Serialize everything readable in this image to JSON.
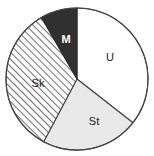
{
  "chart_data": {
    "type": "pie",
    "title": "",
    "subtitle": "",
    "xlabel": "",
    "ylabel": "",
    "legend_position": "none",
    "grid": false,
    "labels_inside": true,
    "start_angle_deg": 0,
    "direction": "clockwise",
    "categories": [
      "U",
      "St",
      "Sk",
      "M"
    ],
    "values": [
      35.5,
      22.0,
      34.0,
      8.5
    ],
    "units": "percent",
    "slices": [
      {
        "label": "U",
        "value": 35.5,
        "start_angle": 0,
        "end_angle": 128,
        "fill_style": "solid-white",
        "fill_color": "#ffffff",
        "stroke_color": "#444444",
        "label_x": 110,
        "label_y": 58,
        "label_on_dark": false
      },
      {
        "label": "St",
        "value": 22.0,
        "start_angle": 128,
        "end_angle": 208,
        "fill_style": "solid-light-gray",
        "fill_color": "#e9e9e9",
        "stroke_color": "#444444",
        "label_x": 94,
        "label_y": 122,
        "label_on_dark": false
      },
      {
        "label": "Sk",
        "value": 34.0,
        "start_angle": 208,
        "end_angle": 330,
        "fill_style": "diagonal-hatch",
        "fill_color": "#ffffff",
        "hatch_color": "#555555",
        "stroke_color": "#444444",
        "label_x": 38,
        "label_y": 84,
        "label_on_dark": false
      },
      {
        "label": "M",
        "value": 8.5,
        "start_angle": 330,
        "end_angle": 360,
        "fill_style": "solid-dark",
        "fill_color": "#303030",
        "stroke_color": "#303030",
        "label_x": 66,
        "label_y": 40,
        "label_on_dark": true
      }
    ],
    "geometry": {
      "center_x": 77,
      "center_y": 79,
      "radius": 71
    }
  },
  "colors": {
    "outline": "#444444",
    "dark_slice": "#303030",
    "light_slice": "#e9e9e9",
    "white_slice": "#ffffff",
    "hatch_line": "#555555",
    "label_dark": "#1a1a1a",
    "label_light": "#ffffff",
    "background": "#ffffff"
  }
}
